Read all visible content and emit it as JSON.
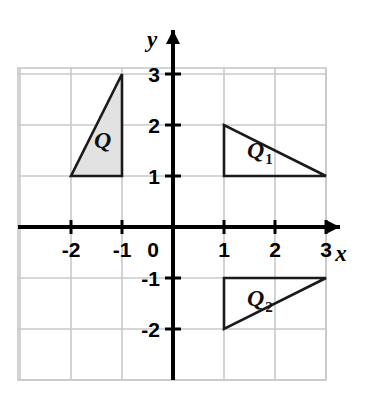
{
  "figure": {
    "background_color": "#ffffff",
    "grid_color": "#c8c8c8",
    "axis_color": "#000000",
    "shape_stroke_color": "#1a1a1a",
    "shape_fill_color": "#e2e2e2"
  },
  "axes": {
    "x_name": "x",
    "y_name": "y",
    "origin_label": "0",
    "x_tick_labels": [
      "-2",
      "-1",
      "1",
      "2",
      "3"
    ],
    "y_tick_labels": [
      "3",
      "2",
      "1",
      "-1",
      "-2"
    ],
    "x_range": [
      -2.9,
      3.1
    ],
    "y_range": [
      -2.9,
      3.1
    ],
    "unit_pixels": 51,
    "grid_visible": true,
    "arrowheads": [
      "x-positive",
      "y-positive"
    ]
  },
  "chart_data": {
    "type": "scatter",
    "xlabel": "x",
    "ylabel": "y",
    "xlim": [
      -2.9,
      3.1
    ],
    "ylim": [
      -2.9,
      3.1
    ],
    "xticks": [
      -2,
      -1,
      0,
      1,
      2,
      3
    ],
    "yticks": [
      -2,
      -1,
      1,
      2,
      3
    ],
    "grid": true,
    "legend": "none",
    "shapes": [
      {
        "name": "Q",
        "label": "Q",
        "subscript": "",
        "filled": true,
        "fill": "#e2e2e2",
        "vertices": [
          [
            -2,
            1
          ],
          [
            -1,
            1
          ],
          [
            -1,
            3
          ]
        ],
        "label_position": [
          -1.55,
          1.55
        ]
      },
      {
        "name": "Q1",
        "label": "Q",
        "subscript": "1",
        "filled": false,
        "fill": "none",
        "vertices": [
          [
            1,
            1
          ],
          [
            1,
            2
          ],
          [
            3,
            1
          ]
        ],
        "label_position": [
          1.45,
          1.35
        ]
      },
      {
        "name": "Q2",
        "label": "Q",
        "subscript": "2",
        "filled": false,
        "fill": "none",
        "vertices": [
          [
            1,
            -1
          ],
          [
            1,
            -2
          ],
          [
            3,
            -1
          ]
        ],
        "label_position": [
          1.45,
          -1.55
        ]
      }
    ]
  }
}
